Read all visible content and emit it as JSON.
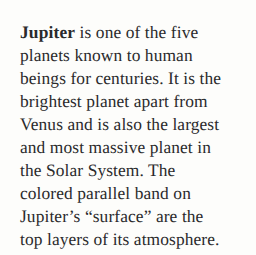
{
  "document": {
    "type": "printed-text-passage",
    "topic": "Jupiter",
    "background_color": "#fdfdfb",
    "text_color": "#2a2a2c",
    "lead_word": "Jupiter",
    "full_text": "Jupiter is one of the five planets known to human beings for centuries. It is the brightest planet apart from Venus and is also the largest and most massive planet in the Solar System. The colored parallel band on Jupiter’s “surface” are the top layers of its atmosphere.",
    "lines": [
      " is one of the five",
      "planets known to human",
      "beings for centuries. It is the",
      "brightest planet apart from",
      "Venus and is also the largest",
      "and most massive planet in",
      "the Solar System. The",
      "colored parallel band on",
      "Jupiter’s “surface” are the",
      "top layers of its atmosphere."
    ]
  }
}
